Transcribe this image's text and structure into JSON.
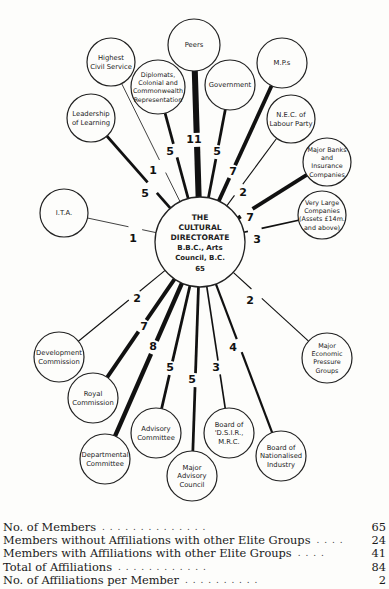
{
  "diagram": {
    "center": {
      "id": "center",
      "x": 200,
      "y": 242,
      "r": 45,
      "title_lines": [
        "THE",
        "CULTURAL",
        "DIRECTORATE"
      ],
      "sub_lines": [
        "B.B.C., Arts",
        "Council, B.C.",
        "65"
      ]
    },
    "nodes": [
      {
        "id": "peers",
        "lines": [
          "Peers"
        ],
        "x": 194,
        "y": 45,
        "r": 26,
        "weight": 11,
        "lx": 194,
        "ly": 140
      },
      {
        "id": "highest-civil-service",
        "lines": [
          "Highest",
          "Civil Service"
        ],
        "x": 111,
        "y": 62,
        "r": 24,
        "weight": 1,
        "lx": 153,
        "ly": 171
      },
      {
        "id": "diplomats",
        "lines": [
          "Diplomats,",
          "Colonial and",
          "Commonwealth",
          "Representation"
        ],
        "x": 158,
        "y": 87,
        "r": 27,
        "weight": 5,
        "lx": 170,
        "ly": 152
      },
      {
        "id": "government",
        "lines": [
          "Government"
        ],
        "x": 230,
        "y": 85,
        "r": 25,
        "weight": 5,
        "lx": 217,
        "ly": 152
      },
      {
        "id": "mps",
        "lines": [
          "M.P.s"
        ],
        "x": 282,
        "y": 63,
        "r": 25,
        "weight": 7,
        "lx": 233,
        "ly": 172
      },
      {
        "id": "nec-labour",
        "lines": [
          "N.E.C. of",
          "Labour Party"
        ],
        "x": 291,
        "y": 119,
        "r": 24,
        "weight": 2,
        "lx": 243,
        "ly": 193
      },
      {
        "id": "major-banks",
        "lines": [
          "Major Banks",
          "and",
          "Insurance",
          "Companies"
        ],
        "x": 327,
        "y": 162,
        "r": 24,
        "weight": 7,
        "lx": 250,
        "ly": 218
      },
      {
        "id": "very-large-companies",
        "lines": [
          "Very Large",
          "Companies",
          "(Assets £14m.",
          "and above)"
        ],
        "x": 322,
        "y": 215,
        "r": 24,
        "weight": 3,
        "lx": 257,
        "ly": 240
      },
      {
        "id": "leadership-of-learning",
        "lines": [
          "Leadership",
          "of Learning"
        ],
        "x": 91,
        "y": 118,
        "r": 24,
        "weight": 5,
        "lx": 145,
        "ly": 194
      },
      {
        "id": "ita",
        "lines": [
          "I.T.A."
        ],
        "x": 64,
        "y": 213,
        "r": 24,
        "weight": 1,
        "lx": 133,
        "ly": 239
      },
      {
        "id": "development-commission",
        "lines": [
          "Development",
          "Commission"
        ],
        "x": 59,
        "y": 357,
        "r": 25,
        "weight": 2,
        "lx": 137,
        "ly": 299
      },
      {
        "id": "royal-commission",
        "lines": [
          "Royal",
          "Commission"
        ],
        "x": 93,
        "y": 398,
        "r": 25,
        "weight": 7,
        "lx": 144,
        "ly": 327
      },
      {
        "id": "departmental-committee",
        "lines": [
          "Departmental",
          "Committee"
        ],
        "x": 105,
        "y": 459,
        "r": 25,
        "weight": 8,
        "lx": 153,
        "ly": 347
      },
      {
        "id": "advisory-committee",
        "lines": [
          "Advisory",
          "Committee"
        ],
        "x": 156,
        "y": 433,
        "r": 25,
        "weight": 5,
        "lx": 170,
        "ly": 368
      },
      {
        "id": "major-advisory-council",
        "lines": [
          "Major",
          "Advisory",
          "Council"
        ],
        "x": 192,
        "y": 476,
        "r": 25,
        "weight": 5,
        "lx": 192,
        "ly": 380
      },
      {
        "id": "board-dsir",
        "lines": [
          "Board of",
          "'D.S.I.R.,",
          "M.R.C."
        ],
        "x": 229,
        "y": 433,
        "r": 25,
        "weight": 3,
        "lx": 216,
        "ly": 368
      },
      {
        "id": "board-nationalised-industry",
        "lines": [
          "Board of",
          "Nationalised",
          "Industry"
        ],
        "x": 281,
        "y": 456,
        "r": 25,
        "weight": 4,
        "lx": 233,
        "ly": 348
      },
      {
        "id": "major-economic-pressure-groups",
        "lines": [
          "Major",
          "Economic",
          "Pressure",
          "Groups"
        ],
        "x": 327,
        "y": 358,
        "r": 25,
        "weight": 2,
        "lx": 250,
        "ly": 301
      }
    ]
  },
  "stats": [
    {
      "label": "No. of Members",
      "dots": ". .     . .     . .     . .     . .     . .     . .",
      "value": "65"
    },
    {
      "label": "Members without Affiliations with other Elite Groups",
      "dots": ". .     . .",
      "value": "24"
    },
    {
      "label": "Members with Affiliations with other Elite Groups",
      "dots": ". .     . .",
      "value": "41"
    },
    {
      "label": "Total of Affiliations",
      "dots": ". .     . .     . .     . .     . .     . .",
      "value": "84"
    },
    {
      "label": "No. of Affiliations per Member",
      "dots": ". .     . .     . .     . .     . .",
      "value": "2"
    }
  ]
}
